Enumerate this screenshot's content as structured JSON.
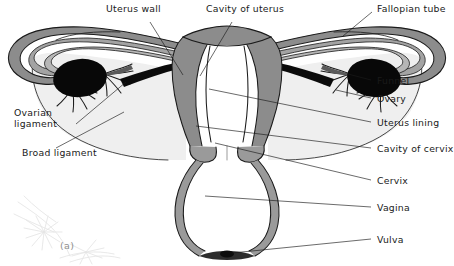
{
  "figure": {
    "caption": "(a)",
    "watermark": "faint-botanical-scan-artifact"
  },
  "colors": {
    "background": "#ffffff",
    "outline": "#1a1a1a",
    "tissue_gray": "#8c8c8c",
    "tissue_gray_light": "#a9a9a9",
    "ligament_fill": "#efefef",
    "ovary_black": "#080808",
    "cavity_white": "#ffffff",
    "label_text": "#1a1a1a",
    "leader_line": "#1a1a1a",
    "watermark": "#e2e2e2"
  },
  "labels": [
    {
      "id": "uterus-wall",
      "text": "Uterus wall",
      "x": 106,
      "y": 9,
      "side": "left",
      "lines": [
        "Uterus wall"
      ]
    },
    {
      "id": "cavity-of-uterus",
      "text": "Cavity of uterus",
      "x": 206,
      "y": 9,
      "side": "left",
      "lines": [
        "Cavity of uterus"
      ]
    },
    {
      "id": "fallopian-tube",
      "text": "Fallopian tube",
      "x": 374,
      "y": 4,
      "side": "right",
      "lines": [
        "Fallopian tube"
      ]
    },
    {
      "id": "funnel",
      "text": "Funnel",
      "x": 374,
      "y": 82,
      "side": "right",
      "lines": [
        "Funnel"
      ]
    },
    {
      "id": "ovary",
      "text": "Ovary",
      "x": 374,
      "y": 100,
      "side": "right",
      "lines": [
        "Ovary"
      ]
    },
    {
      "id": "uterus-lining",
      "text": "Uterus lining",
      "x": 374,
      "y": 124,
      "side": "right",
      "lines": [
        "Uterus lining"
      ]
    },
    {
      "id": "cavity-of-cervix",
      "text": "Cavity of cervix",
      "x": 374,
      "y": 150,
      "side": "right",
      "lines": [
        "Cavity of cervix"
      ]
    },
    {
      "id": "cervix",
      "text": "Cervix",
      "x": 374,
      "y": 182,
      "side": "right",
      "lines": [
        "Cervix"
      ]
    },
    {
      "id": "vagina",
      "text": "Vagina",
      "x": 374,
      "y": 209,
      "side": "right",
      "lines": [
        "Vagina"
      ]
    },
    {
      "id": "vulva",
      "text": "Vulva",
      "x": 374,
      "y": 241,
      "side": "right",
      "lines": [
        "Vulva"
      ]
    },
    {
      "id": "ovarian-ligament",
      "text": "Ovarian ligament",
      "x": 14,
      "y": 113,
      "side": "left",
      "lines": [
        "Ovarian",
        "ligament"
      ]
    },
    {
      "id": "broad-ligament",
      "text": "Broad ligament",
      "x": 22,
      "y": 152,
      "side": "left",
      "lines": [
        "Broad ligament"
      ]
    }
  ],
  "leader_lines": [
    {
      "id": "leader-uterus-wall",
      "from": [
        150,
        22
      ],
      "to": [
        183,
        75
      ]
    },
    {
      "id": "leader-cavity-of-uterus",
      "from": [
        232,
        22
      ],
      "to": [
        200,
        76
      ]
    },
    {
      "id": "leader-fallopian-tube",
      "from": [
        372,
        12
      ],
      "to": [
        343,
        36
      ]
    },
    {
      "id": "leader-funnel",
      "from": [
        371,
        80
      ],
      "to": [
        348,
        74
      ]
    },
    {
      "id": "leader-ovary",
      "from": [
        371,
        98
      ],
      "to": [
        336,
        90
      ]
    },
    {
      "id": "leader-uterus-lining",
      "from": [
        371,
        122
      ],
      "to": [
        209,
        89
      ]
    },
    {
      "id": "leader-cavity-of-cervix",
      "from": [
        371,
        148
      ],
      "to": [
        196,
        126
      ]
    },
    {
      "id": "leader-cervix",
      "from": [
        371,
        180
      ],
      "to": [
        215,
        143
      ]
    },
    {
      "id": "leader-vagina",
      "from": [
        371,
        207
      ],
      "to": [
        205,
        196
      ]
    },
    {
      "id": "leader-vulva",
      "from": [
        371,
        239
      ],
      "to": [
        203,
        250
      ]
    },
    {
      "id": "leader-ovarian-ligament",
      "from": [
        76,
        124
      ],
      "to": [
        120,
        80
      ]
    },
    {
      "id": "leader-broad-ligament",
      "from": [
        56,
        148
      ],
      "to": [
        122,
        114
      ]
    }
  ],
  "anatomy_parts": [
    {
      "id": "fundus",
      "name": "uterine fundus",
      "fill": "tissue_gray"
    },
    {
      "id": "uterus-body",
      "name": "uterus body wall",
      "fill": "tissue_gray"
    },
    {
      "id": "uterine-cavity",
      "name": "cavity of uterus",
      "fill": "cavity_white"
    },
    {
      "id": "cervix",
      "name": "cervix",
      "fill": "tissue_gray"
    },
    {
      "id": "vagina",
      "name": "vagina",
      "fill": "tissue_gray_light"
    },
    {
      "id": "broad-ligament-left",
      "name": "broad ligament (left)",
      "fill": "ligament_fill"
    },
    {
      "id": "broad-ligament-right",
      "name": "broad ligament (right)",
      "fill": "ligament_fill"
    },
    {
      "id": "fallopian-tube-left",
      "name": "fallopian tube (left)",
      "fill": "tissue_gray"
    },
    {
      "id": "fallopian-tube-right",
      "name": "fallopian tube (right)",
      "fill": "tissue_gray"
    },
    {
      "id": "ovary-left",
      "name": "ovary (left)",
      "fill": "ovary_black"
    },
    {
      "id": "ovary-right",
      "name": "ovary (right)",
      "fill": "ovary_black"
    },
    {
      "id": "funnel-left",
      "name": "funnel / fimbriae (left)",
      "fill": "tissue_gray"
    },
    {
      "id": "funnel-right",
      "name": "funnel / fimbriae (right)",
      "fill": "tissue_gray"
    },
    {
      "id": "ovarian-ligament-left",
      "name": "ovarian ligament (left)",
      "fill": "ovary_black"
    },
    {
      "id": "ovarian-ligament-right",
      "name": "ovarian ligament (right)",
      "fill": "ovary_black"
    }
  ]
}
